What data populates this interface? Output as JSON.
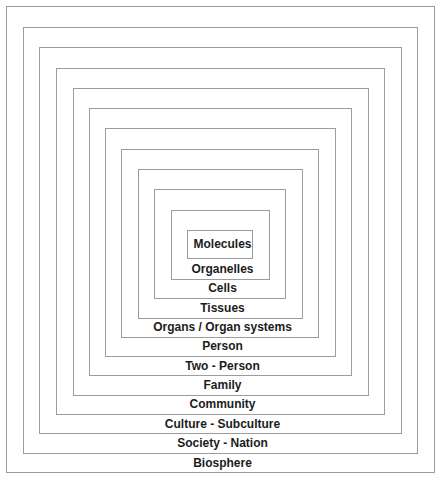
{
  "diagram": {
    "type": "nested-squares",
    "line_color": "#9c9c9c",
    "text_color": "#1c1c1c",
    "levels": [
      {
        "label": "Biosphere",
        "box": [
          6,
          6,
          434,
          472
        ]
      },
      {
        "label": "Society - Nation",
        "box": [
          23,
          27,
          417,
          453
        ]
      },
      {
        "label": "Culture - Subculture",
        "box": [
          39,
          47,
          401,
          433
        ]
      },
      {
        "label": "Community",
        "box": [
          56,
          68,
          384,
          414
        ]
      },
      {
        "label": "Family",
        "box": [
          73,
          88,
          368,
          395
        ]
      },
      {
        "label": "Two - Person",
        "box": [
          89,
          108,
          351,
          375
        ]
      },
      {
        "label": "Person",
        "box": [
          105,
          128,
          335,
          356
        ]
      },
      {
        "label": "Organs / Organ systems",
        "box": [
          121,
          149,
          318,
          337
        ]
      },
      {
        "label": "Tissues",
        "box": [
          138,
          169,
          302,
          318
        ]
      },
      {
        "label": "Cells",
        "box": [
          154,
          189,
          285,
          298
        ]
      },
      {
        "label": "Organelles",
        "box": [
          171,
          210,
          269,
          279
        ]
      },
      {
        "label": "Molecules",
        "box": [
          187,
          230,
          252,
          258
        ]
      }
    ]
  }
}
